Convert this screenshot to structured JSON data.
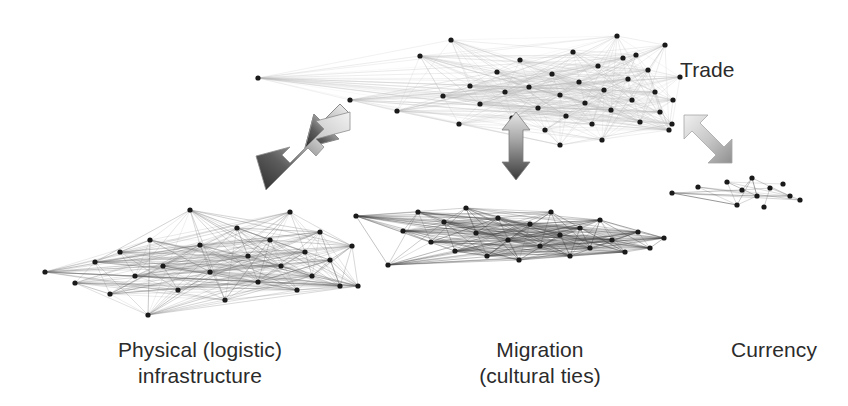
{
  "figure": {
    "background_color": "#ffffff",
    "text_color": "#2b2b2b",
    "node_color": "#1a1a1a"
  },
  "captions": {
    "trade": "Trade",
    "physical_line1": "Physical (logistic)",
    "physical_line2": "infrastructure",
    "migration_line1": "Migration",
    "migration_line2": "(cultural ties)",
    "currency": "Currency"
  },
  "arrows": {
    "left": {
      "label": "trade-physical-arrow",
      "direction": "bidirectional-diagonal-down-left",
      "gradient_from": "#efefef",
      "gradient_to": "#333333"
    },
    "middle": {
      "label": "trade-migration-arrow",
      "direction": "bidirectional-vertical",
      "gradient_from": "#e3e3e3",
      "gradient_to": "#3a3a3a"
    },
    "right": {
      "label": "trade-currency-arrow",
      "direction": "bidirectional-diagonal-down-right",
      "gradient_from": "#efefef",
      "gradient_to": "#9a9a9a"
    }
  },
  "chart_data": {
    "type": "scatter",
    "title": "",
    "xlabel": "",
    "ylabel": "",
    "layers": [
      {
        "name": "trade",
        "label": "Trade",
        "edge_color": "#b8b8b8",
        "edge_opacity": 0.5,
        "density": "high",
        "node_count": 42,
        "nodes": [
          [
            258,
            78
          ],
          [
            350,
            100
          ],
          [
            397,
            111
          ],
          [
            420,
            56
          ],
          [
            451,
            40
          ],
          [
            443,
            96
          ],
          [
            470,
            86
          ],
          [
            459,
            124
          ],
          [
            480,
            104
          ],
          [
            497,
            72
          ],
          [
            505,
            92
          ],
          [
            512,
            118
          ],
          [
            520,
            60
          ],
          [
            529,
            87
          ],
          [
            538,
            108
          ],
          [
            545,
            130
          ],
          [
            552,
            74
          ],
          [
            560,
            95
          ],
          [
            566,
            116
          ],
          [
            573,
            52
          ],
          [
            579,
            82
          ],
          [
            585,
            103
          ],
          [
            592,
            124
          ],
          [
            598,
            66
          ],
          [
            604,
            90
          ],
          [
            611,
            110
          ],
          [
            617,
            36
          ],
          [
            623,
            58
          ],
          [
            628,
            79
          ],
          [
            632,
            100
          ],
          [
            636,
            55
          ],
          [
            640,
            122
          ],
          [
            648,
            70
          ],
          [
            655,
            92
          ],
          [
            660,
            112
          ],
          [
            665,
            45
          ],
          [
            669,
            130
          ],
          [
            673,
            100
          ],
          [
            680,
            77
          ],
          [
            672,
            124
          ],
          [
            560,
            145
          ],
          [
            602,
            140
          ]
        ],
        "bbox": [
          255,
          30,
          690,
          150
        ]
      },
      {
        "name": "physical",
        "label": "Physical (logistic) infrastructure",
        "edge_color": "#6b6b6b",
        "edge_opacity": 0.55,
        "density": "very high",
        "node_count": 28,
        "nodes": [
          [
            45,
            272
          ],
          [
            75,
            283
          ],
          [
            95,
            262
          ],
          [
            110,
            294
          ],
          [
            120,
            252
          ],
          [
            135,
            276
          ],
          [
            150,
            240
          ],
          [
            163,
            266
          ],
          [
            178,
            290
          ],
          [
            190,
            210
          ],
          [
            200,
            245
          ],
          [
            210,
            272
          ],
          [
            225,
            300
          ],
          [
            237,
            228
          ],
          [
            248,
            256
          ],
          [
            258,
            282
          ],
          [
            270,
            240
          ],
          [
            281,
            266
          ],
          [
            290,
            212
          ],
          [
            297,
            290
          ],
          [
            305,
            252
          ],
          [
            312,
            276
          ],
          [
            320,
            232
          ],
          [
            330,
            260
          ],
          [
            340,
            286
          ],
          [
            352,
            246
          ],
          [
            358,
            286
          ],
          [
            148,
            315
          ]
        ],
        "bbox": [
          42,
          205,
          362,
          320
        ]
      },
      {
        "name": "migration",
        "label": "Migration (cultural ties)",
        "edge_color": "#444444",
        "edge_opacity": 0.6,
        "density": "very high",
        "node_count": 26,
        "nodes": [
          [
            356,
            216
          ],
          [
            388,
            265
          ],
          [
            403,
            231
          ],
          [
            418,
            212
          ],
          [
            431,
            242
          ],
          [
            444,
            222
          ],
          [
            455,
            251
          ],
          [
            466,
            208
          ],
          [
            476,
            233
          ],
          [
            487,
            256
          ],
          [
            498,
            218
          ],
          [
            508,
            240
          ],
          [
            519,
            260
          ],
          [
            530,
            224
          ],
          [
            540,
            246
          ],
          [
            551,
            212
          ],
          [
            560,
            235
          ],
          [
            570,
            256
          ],
          [
            580,
            228
          ],
          [
            590,
            248
          ],
          [
            600,
            220
          ],
          [
            612,
            240
          ],
          [
            625,
            252
          ],
          [
            638,
            232
          ],
          [
            650,
            248
          ],
          [
            664,
            238
          ]
        ],
        "bbox": [
          352,
          200,
          668,
          270
        ]
      },
      {
        "name": "currency",
        "label": "Currency",
        "edge_color": "#5a5a5a",
        "edge_opacity": 0.75,
        "density": "low",
        "node_count": 12,
        "nodes": [
          [
            672,
            193
          ],
          [
            698,
            187
          ],
          [
            727,
            182
          ],
          [
            742,
            190
          ],
          [
            752,
            178
          ],
          [
            757,
            196
          ],
          [
            770,
            188
          ],
          [
            783,
            184
          ],
          [
            790,
            196
          ],
          [
            800,
            200
          ],
          [
            737,
            205
          ],
          [
            764,
            207
          ]
        ],
        "bbox": [
          668,
          175,
          812,
          212
        ]
      }
    ]
  }
}
